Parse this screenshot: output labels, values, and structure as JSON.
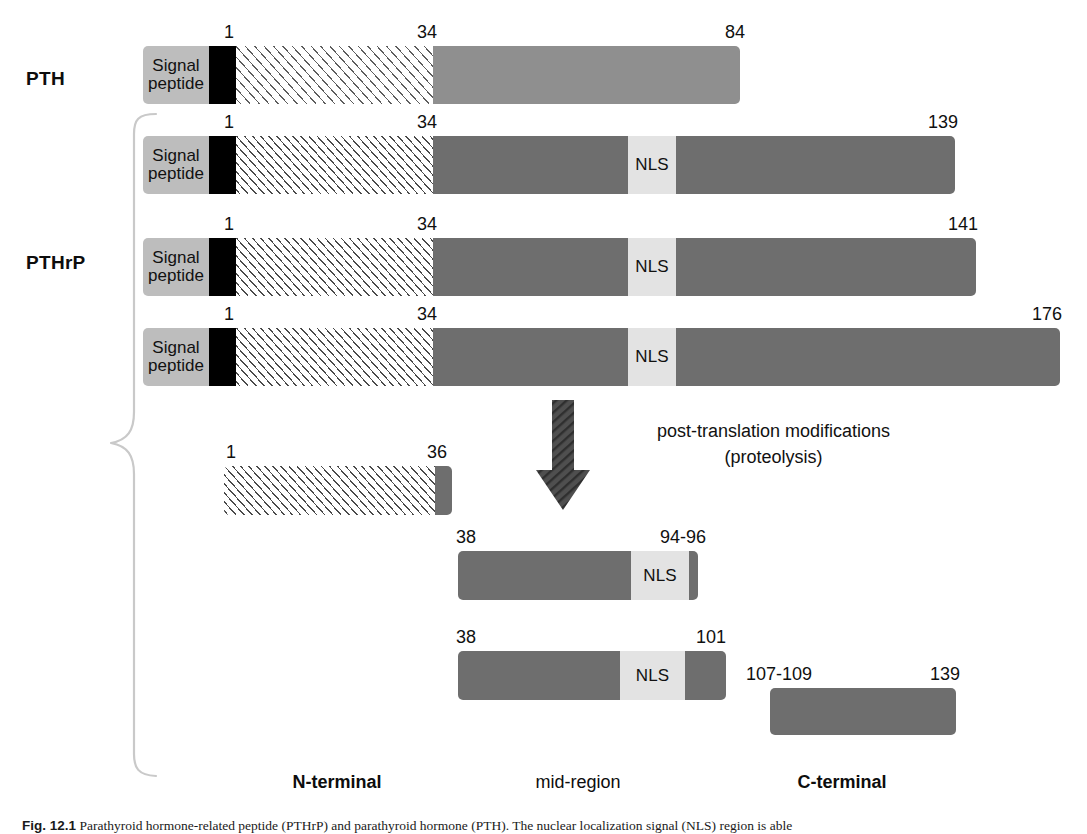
{
  "figure": {
    "groups": [
      {
        "id": "pth",
        "label": "PTH"
      },
      {
        "id": "pthrp",
        "label": "PTHrP"
      }
    ],
    "signal_peptide_label_line1": "Signal",
    "signal_peptide_label_line2": "peptide",
    "nls_label": "NLS",
    "ptm_line1": "post-translation modifications",
    "ptm_line2": "(proteolysis)",
    "region_labels": [
      {
        "text": "N-terminal",
        "bold": true
      },
      {
        "text": "mid-region",
        "bold": false
      },
      {
        "text": "C-terminal",
        "bold": true
      }
    ],
    "bars": [
      {
        "name": "pth-precursor",
        "start_label": "1",
        "mid_label": "34",
        "end_label": "84"
      },
      {
        "name": "pthrp-139",
        "start_label": "1",
        "mid_label": "34",
        "end_label": "139"
      },
      {
        "name": "pthrp-141",
        "start_label": "1",
        "mid_label": "34",
        "end_label": "141"
      },
      {
        "name": "pthrp-176",
        "start_label": "1",
        "mid_label": "34",
        "end_label": "176"
      },
      {
        "name": "fragment-n-terminal",
        "start_label": "1",
        "end_label": "36"
      },
      {
        "name": "fragment-mid-94-96",
        "start_label": "38",
        "end_label": "94-96"
      },
      {
        "name": "fragment-mid-101",
        "start_label": "38",
        "end_label": "101"
      },
      {
        "name": "fragment-c-terminal",
        "start_label": "107-109",
        "end_label": "139"
      }
    ],
    "colors": {
      "signal_peptide": "#bdbdbd",
      "pro_sequence": "#000000",
      "pth_mature": "#8f8f8f",
      "pthrp_mature": "#6e6e6e",
      "nls": "#e3e3e3",
      "arrow": "#4f4f4f"
    }
  },
  "caption": {
    "figure_number": "Fig. 12.1",
    "text": "Parathyroid hormone-related peptide (PTHrP) and parathyroid hormone (PTH). The nuclear localization signal (NLS) region is able"
  }
}
